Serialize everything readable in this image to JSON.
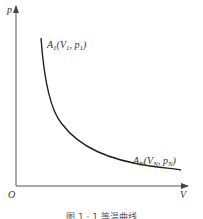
{
  "diagram": {
    "type": "isotherm p-V curve",
    "axes": {
      "y_label": "p",
      "x_label": "V",
      "origin_label": "O"
    },
    "points": [
      {
        "label_main": "A",
        "label_sub": "1",
        "label_rest": "(V",
        "v_sub": "1",
        "mid": ", p",
        "p_sub": "1",
        "close": ")"
      },
      {
        "label_main": "A",
        "label_sub": "N",
        "label_rest": "(V",
        "v_sub": "N",
        "mid": ", p",
        "p_sub": "N",
        "close": ")"
      }
    ],
    "caption": "图 1 · 1  等温曲线"
  }
}
